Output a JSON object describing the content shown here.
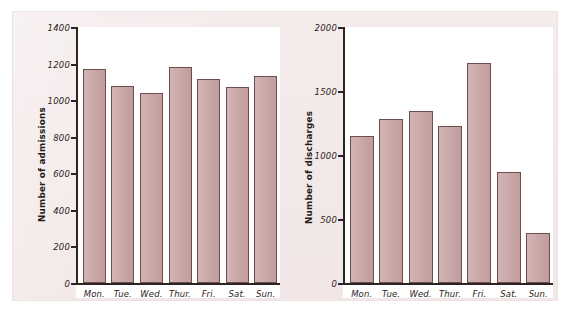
{
  "figure": {
    "background_color": "#f3e9e9",
    "plot_background_color": "#ffffff",
    "bar_fill_color": "#c9a3a3",
    "bar_border_color": "#6e4d4d",
    "axis_color": "#2c2420"
  },
  "chart_data": [
    {
      "type": "bar",
      "title": "",
      "xlabel": "",
      "ylabel": "Number of admissions",
      "categories": [
        "Mon.",
        "Tue.",
        "Wed.",
        "Thur.",
        "Fri.",
        "Sat.",
        "Sun."
      ],
      "values": [
        1170,
        1075,
        1040,
        1180,
        1115,
        1070,
        1130
      ],
      "ylim": [
        0,
        1400
      ],
      "yticks": [
        0,
        200,
        400,
        600,
        800,
        1000,
        1200,
        1400
      ],
      "ytick_labels": [
        "0",
        "200",
        "400",
        "600",
        "800",
        "1000",
        "1200",
        "1400"
      ],
      "grid": false,
      "legend": "none"
    },
    {
      "type": "bar",
      "title": "",
      "xlabel": "",
      "ylabel": "Number of discharges",
      "categories": [
        "Mon.",
        "Tue.",
        "Wed.",
        "Thur.",
        "Fri.",
        "Sat.",
        "Sun."
      ],
      "values": [
        1150,
        1280,
        1340,
        1225,
        1720,
        870,
        390
      ],
      "ylim": [
        0,
        2000
      ],
      "yticks": [
        0,
        500,
        1000,
        1500,
        2000
      ],
      "ytick_labels": [
        "0",
        "500",
        "1000",
        "1500",
        "2000"
      ],
      "grid": false,
      "legend": "none"
    }
  ]
}
